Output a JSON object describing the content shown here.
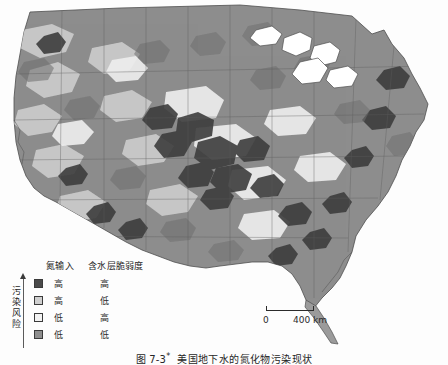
{
  "figure": {
    "caption_number": "图 7-3",
    "caption_star": "*",
    "caption_title": "美国地下水的氮化物污染现状"
  },
  "map": {
    "region_name": "美国本土",
    "background_color": "#ffffff",
    "outline_color": "#4f4f4f",
    "water_color": "#ffffff",
    "fill_classes": {
      "high_high": "#4a4a4a",
      "high_low": "#cfcfcf",
      "low_high": "#f2f2f2",
      "low_low": "#8e8e8e"
    }
  },
  "legend": {
    "risk_axis_label": "污染风险",
    "headers": {
      "nitrogen_input": "氮输入",
      "aquifer_vulnerability": "含水层脆弱度"
    },
    "rows": [
      {
        "swatch": "sw-hh",
        "nitrogen_input": "高",
        "aquifer_vulnerability": "高"
      },
      {
        "swatch": "sw-hl",
        "nitrogen_input": "高",
        "aquifer_vulnerability": "低"
      },
      {
        "swatch": "sw-lh",
        "nitrogen_input": "低",
        "aquifer_vulnerability": "高"
      },
      {
        "swatch": "sw-ll",
        "nitrogen_input": "低",
        "aquifer_vulnerability": "低"
      }
    ]
  },
  "scalebar": {
    "zero": "0",
    "max": "400 km"
  }
}
